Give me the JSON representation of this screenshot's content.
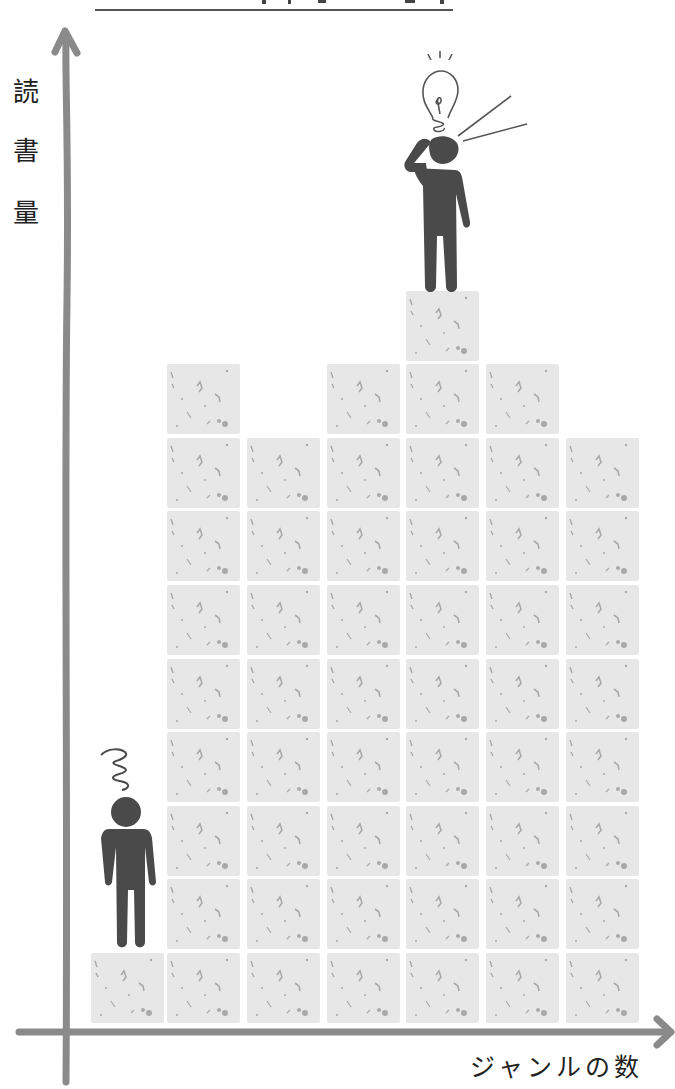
{
  "header": {
    "title_truncated": true
  },
  "chart_data": {
    "type": "bar",
    "style": "stacked-square-blocks (pictogram)",
    "title": "",
    "xlabel": "ジャンルの数",
    "ylabel": "読書量",
    "categories": [
      "1",
      "2",
      "3",
      "4",
      "5",
      "6",
      "7"
    ],
    "values": [
      1,
      9,
      8,
      9,
      10,
      9,
      8
    ],
    "grid": false,
    "legend": null,
    "annotations": [
      {
        "type": "figure",
        "description": "confused person (spiral above head) standing on column 1",
        "column": 0
      },
      {
        "type": "figure",
        "description": "person with light bulb idea standing on tallest column",
        "column": 4
      }
    ]
  },
  "axes": {
    "ylabel_chars": [
      "読",
      "書",
      "量"
    ],
    "xlabel": "ジャンルの数",
    "color": "#8a8a8a"
  },
  "colors": {
    "block": "#e7e7e7",
    "block_speckle": "#a9a9a9",
    "figure": "#4a4a4a",
    "axis": "#8a8a8a"
  },
  "figures": {
    "left_person": "confused-person",
    "right_person": "idea-person"
  }
}
